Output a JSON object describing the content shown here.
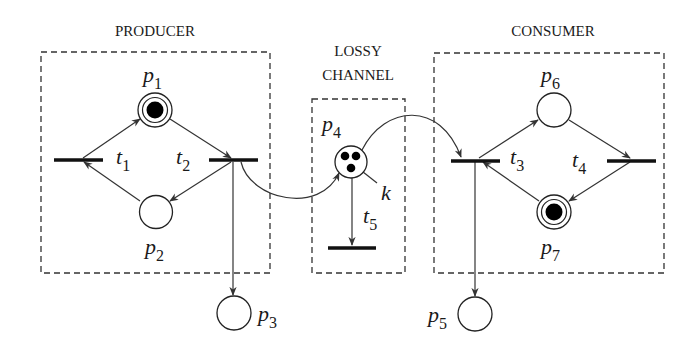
{
  "sections": {
    "producer": {
      "title": "PRODUCER"
    },
    "channel": {
      "title_line1": "LOSSY",
      "title_line2": "CHANNEL"
    },
    "consumer": {
      "title": "CONSUMER"
    }
  },
  "places": {
    "p1": {
      "base": "p",
      "sub": "1",
      "tokens": 1
    },
    "p2": {
      "base": "p",
      "sub": "2",
      "tokens": 0
    },
    "p3": {
      "base": "p",
      "sub": "3",
      "tokens": 0
    },
    "p4": {
      "base": "p",
      "sub": "4",
      "tokens": 3,
      "capacity_label": "k"
    },
    "p5": {
      "base": "p",
      "sub": "5",
      "tokens": 0
    },
    "p6": {
      "base": "p",
      "sub": "6",
      "tokens": 0
    },
    "p7": {
      "base": "p",
      "sub": "7",
      "tokens": 1
    }
  },
  "transitions": {
    "t1": {
      "base": "t",
      "sub": "1"
    },
    "t2": {
      "base": "t",
      "sub": "2"
    },
    "t3": {
      "base": "t",
      "sub": "3"
    },
    "t4": {
      "base": "t",
      "sub": "4"
    },
    "t5": {
      "base": "t",
      "sub": "5"
    }
  },
  "arcs": [
    {
      "from": "t1",
      "to": "p1"
    },
    {
      "from": "p1",
      "to": "t2"
    },
    {
      "from": "t2",
      "to": "p2"
    },
    {
      "from": "p2",
      "to": "t1"
    },
    {
      "from": "t2",
      "to": "p3"
    },
    {
      "from": "t2",
      "to": "p4"
    },
    {
      "from": "p4",
      "to": "t5"
    },
    {
      "from": "p4",
      "to": "t3"
    },
    {
      "from": "t3",
      "to": "p6"
    },
    {
      "from": "p6",
      "to": "t4"
    },
    {
      "from": "t4",
      "to": "p7"
    },
    {
      "from": "p7",
      "to": "t3"
    },
    {
      "from": "t3",
      "to": "p5"
    }
  ]
}
